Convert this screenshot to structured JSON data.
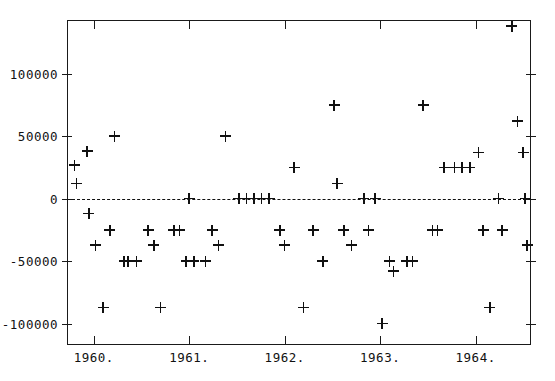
{
  "chart_data": {
    "type": "scatter",
    "title": "",
    "xlabel": "",
    "ylabel": "",
    "xlim": [
      1959.72,
      1964.58
    ],
    "ylim": [
      -117000,
      143000
    ],
    "grid": false,
    "legend": null,
    "marker": "plus",
    "reference_line": {
      "y": 0,
      "style": "dashed"
    },
    "xticks": [
      1960,
      1961,
      1962,
      1963,
      1964
    ],
    "xticklabels": [
      "1960.",
      "1961.",
      "1962.",
      "1963.",
      "1964."
    ],
    "yticks": [
      100000,
      50000,
      0,
      -50000,
      -100000
    ],
    "yticklabels": [
      "100000",
      "50000",
      "0",
      "-50000",
      "-100000"
    ],
    "points": [
      {
        "x": 1959.8,
        "y": 27000
      },
      {
        "x": 1959.82,
        "y": 12000
      },
      {
        "x": 1959.93,
        "y": 38000
      },
      {
        "x": 1959.95,
        "y": -12000
      },
      {
        "x": 1960.02,
        "y": -37000
      },
      {
        "x": 1960.1,
        "y": -87000
      },
      {
        "x": 1960.17,
        "y": -25000
      },
      {
        "x": 1960.22,
        "y": 50000
      },
      {
        "x": 1960.32,
        "y": -50000
      },
      {
        "x": 1960.36,
        "y": -50000
      },
      {
        "x": 1960.45,
        "y": -50000
      },
      {
        "x": 1960.57,
        "y": -25000
      },
      {
        "x": 1960.63,
        "y": -37000
      },
      {
        "x": 1960.7,
        "y": -87000
      },
      {
        "x": 1960.84,
        "y": -25000
      },
      {
        "x": 1960.9,
        "y": -25000
      },
      {
        "x": 1960.97,
        "y": -50000
      },
      {
        "x": 1961.0,
        "y": 0
      },
      {
        "x": 1961.05,
        "y": -50000
      },
      {
        "x": 1961.17,
        "y": -50000
      },
      {
        "x": 1961.24,
        "y": -25000
      },
      {
        "x": 1961.31,
        "y": -37000
      },
      {
        "x": 1961.38,
        "y": 50000
      },
      {
        "x": 1961.52,
        "y": 0
      },
      {
        "x": 1961.6,
        "y": 0
      },
      {
        "x": 1961.68,
        "y": 0
      },
      {
        "x": 1961.76,
        "y": 0
      },
      {
        "x": 1961.84,
        "y": 0
      },
      {
        "x": 1961.95,
        "y": -25000
      },
      {
        "x": 1962.0,
        "y": -37000
      },
      {
        "x": 1962.1,
        "y": 25000
      },
      {
        "x": 1962.2,
        "y": -87000
      },
      {
        "x": 1962.3,
        "y": -25000
      },
      {
        "x": 1962.4,
        "y": -50000
      },
      {
        "x": 1962.52,
        "y": 75000
      },
      {
        "x": 1962.55,
        "y": 12000
      },
      {
        "x": 1962.62,
        "y": -25000
      },
      {
        "x": 1962.7,
        "y": -37000
      },
      {
        "x": 1962.83,
        "y": 0
      },
      {
        "x": 1962.88,
        "y": -25000
      },
      {
        "x": 1962.95,
        "y": 0
      },
      {
        "x": 1963.02,
        "y": -100000
      },
      {
        "x": 1963.1,
        "y": -50000
      },
      {
        "x": 1963.14,
        "y": -58000
      },
      {
        "x": 1963.28,
        "y": -50000
      },
      {
        "x": 1963.34,
        "y": -50000
      },
      {
        "x": 1963.45,
        "y": 75000
      },
      {
        "x": 1963.55,
        "y": -25000
      },
      {
        "x": 1963.6,
        "y": -25000
      },
      {
        "x": 1963.67,
        "y": 25000
      },
      {
        "x": 1963.78,
        "y": 25000
      },
      {
        "x": 1963.86,
        "y": 25000
      },
      {
        "x": 1963.94,
        "y": 25000
      },
      {
        "x": 1964.03,
        "y": 37000
      },
      {
        "x": 1964.08,
        "y": -25000
      },
      {
        "x": 1964.15,
        "y": -87000
      },
      {
        "x": 1964.24,
        "y": 0
      },
      {
        "x": 1964.28,
        "y": -25000
      },
      {
        "x": 1964.38,
        "y": 138000
      },
      {
        "x": 1964.44,
        "y": 62000
      },
      {
        "x": 1964.5,
        "y": 37000
      },
      {
        "x": 1964.52,
        "y": 0
      },
      {
        "x": 1964.54,
        "y": -37000
      }
    ]
  }
}
